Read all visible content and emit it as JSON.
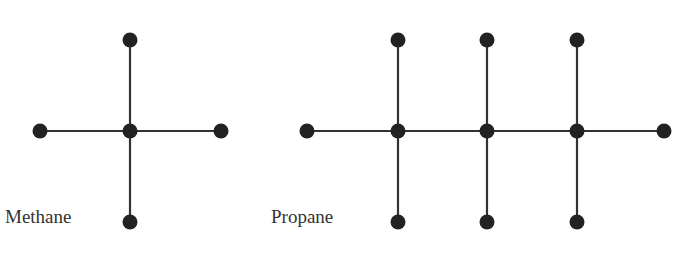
{
  "molecules": [
    {
      "name": "Methane",
      "label_pos": [
        5,
        206
      ],
      "nodes": [
        [
          130,
          131
        ],
        [
          130,
          40
        ],
        [
          130,
          222
        ],
        [
          40,
          131
        ],
        [
          221,
          131
        ]
      ],
      "edges": [
        [
          0,
          1
        ],
        [
          0,
          2
        ],
        [
          0,
          3
        ],
        [
          0,
          4
        ]
      ]
    },
    {
      "name": "Propane",
      "label_pos": [
        271,
        206
      ],
      "nodes": [
        [
          398,
          131
        ],
        [
          487,
          131
        ],
        [
          577,
          131
        ],
        [
          307,
          131
        ],
        [
          664,
          131
        ],
        [
          398,
          40
        ],
        [
          487,
          40
        ],
        [
          577,
          40
        ],
        [
          398,
          222
        ],
        [
          487,
          222
        ],
        [
          577,
          222
        ]
      ],
      "edges": [
        [
          3,
          0
        ],
        [
          0,
          1
        ],
        [
          1,
          2
        ],
        [
          2,
          4
        ],
        [
          0,
          5
        ],
        [
          1,
          6
        ],
        [
          2,
          7
        ],
        [
          0,
          8
        ],
        [
          1,
          9
        ],
        [
          2,
          10
        ]
      ]
    }
  ],
  "colors": {
    "node": "#222222",
    "edge": "#333333",
    "text": "#333333"
  }
}
